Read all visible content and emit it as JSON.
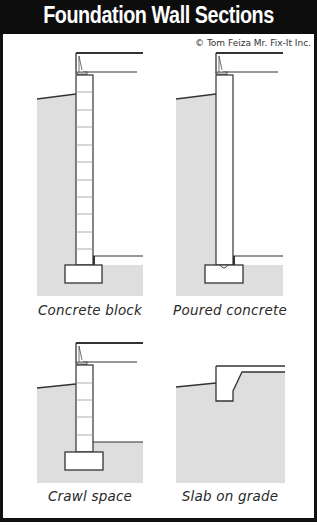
{
  "header": {
    "title": "Foundation Wall Sections"
  },
  "credit": "© Tom Feiza Mr. Fix-It Inc.",
  "colors": {
    "title_bg": "#0d0d0d",
    "title_text": "#ffffff",
    "soil": "#dedede",
    "line": "#333333"
  },
  "panels": [
    {
      "id": "concrete-block",
      "caption": "Concrete block"
    },
    {
      "id": "poured-concrete",
      "caption": "Poured concrete"
    },
    {
      "id": "crawl-space",
      "caption": "Crawl space"
    },
    {
      "id": "slab-on-grade",
      "caption": "Slab on grade"
    }
  ]
}
